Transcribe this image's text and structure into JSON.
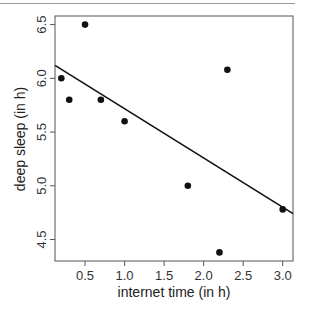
{
  "chart_data": {
    "type": "scatter",
    "title": "",
    "xlabel": "internet time (in h)",
    "ylabel": "deep sleep (in h)",
    "xlim": [
      0.12,
      3.13
    ],
    "ylim": [
      4.3,
      6.58
    ],
    "xticks": [
      0.5,
      1.0,
      1.5,
      2.0,
      2.5,
      3.0
    ],
    "xtick_labels": [
      "0.5",
      "1.0",
      "1.5",
      "2.0",
      "2.5",
      "3.0"
    ],
    "yticks": [
      4.5,
      5.0,
      5.5,
      6.0,
      6.5
    ],
    "ytick_labels": [
      "4.5",
      "5.0",
      "5.5",
      "6.0",
      "6.5"
    ],
    "grid": false,
    "points": [
      {
        "x": 0.2,
        "y": 6.0
      },
      {
        "x": 0.3,
        "y": 5.8
      },
      {
        "x": 0.5,
        "y": 6.5
      },
      {
        "x": 0.7,
        "y": 5.8
      },
      {
        "x": 1.0,
        "y": 5.6
      },
      {
        "x": 1.8,
        "y": 5.0
      },
      {
        "x": 2.2,
        "y": 4.38
      },
      {
        "x": 2.3,
        "y": 6.08
      },
      {
        "x": 3.0,
        "y": 4.78
      }
    ],
    "regression_line": {
      "intercept": 6.175,
      "slope": -0.458
    },
    "colors": {
      "points": "#111111",
      "line": "#111111",
      "frame": "#555555"
    }
  }
}
